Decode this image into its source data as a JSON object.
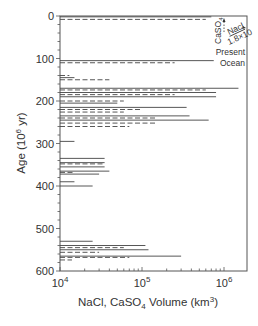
{
  "chart_data": {
    "type": "bar",
    "orientation": "horizontal",
    "title": "",
    "xlabel": "NaCl, CaSO4 Volume (km3)",
    "xlabel_parts": {
      "pre": "NaCl, CaSO",
      "sub": "4",
      "mid": " Volume (km",
      "sup": "3",
      "post": ")"
    },
    "ylabel": "Age (10^6 yr)",
    "ylabel_parts": {
      "pre": "Age (10",
      "sup": "6",
      "post": " yr)"
    },
    "xscale": "log",
    "xlim": [
      10000,
      2000000
    ],
    "ylim": [
      0,
      600
    ],
    "y_inverted": true,
    "grid": false,
    "x_ticks": [
      {
        "base": "10",
        "exp": "4",
        "value": 10000
      },
      {
        "base": "10",
        "exp": "5",
        "value": 100000
      },
      {
        "base": "10",
        "exp": "6",
        "value": 1000000
      }
    ],
    "y_ticks": [
      "0",
      "100",
      "200",
      "300",
      "400",
      "500",
      "600"
    ],
    "legend": [
      {
        "name": "NaCl",
        "style": "solid"
      },
      {
        "name": "CaSO4",
        "style": "dashed"
      }
    ],
    "annotation": {
      "caso4_label": "CaSO",
      "caso4_sub": "4",
      "nacl_label": "Nacl",
      "factor": "1.8×10",
      "present_label": "Present",
      "ocean_label": "Ocean"
    },
    "series": [
      {
        "name": "NaCl",
        "style": "solid",
        "points": [
          {
            "age": 2,
            "volume": 700000
          },
          {
            "age": 105,
            "volume": 750000
          },
          {
            "age": 145,
            "volume": 15000
          },
          {
            "age": 170,
            "volume": 1500000
          },
          {
            "age": 180,
            "volume": 800000
          },
          {
            "age": 190,
            "volume": 800000
          },
          {
            "age": 205,
            "volume": 50000
          },
          {
            "age": 215,
            "volume": 350000
          },
          {
            "age": 235,
            "volume": 380000
          },
          {
            "age": 245,
            "volume": 650000
          },
          {
            "age": 295,
            "volume": 15000
          },
          {
            "age": 335,
            "volume": 35000
          },
          {
            "age": 345,
            "volume": 35000
          },
          {
            "age": 355,
            "volume": 35000
          },
          {
            "age": 365,
            "volume": 40000
          },
          {
            "age": 372,
            "volume": 30000
          },
          {
            "age": 390,
            "volume": 15000
          },
          {
            "age": 400,
            "volume": 25000
          },
          {
            "age": 530,
            "volume": 25000
          },
          {
            "age": 540,
            "volume": 110000
          },
          {
            "age": 550,
            "volume": 120000
          },
          {
            "age": 565,
            "volume": 300000
          }
        ]
      },
      {
        "name": "CaSO4",
        "style": "dashed",
        "points": [
          {
            "age": 8,
            "volume": 600000
          },
          {
            "age": 110,
            "volume": 250000
          },
          {
            "age": 140,
            "volume": 13000
          },
          {
            "age": 150,
            "volume": 40000
          },
          {
            "age": 174,
            "volume": 600000
          },
          {
            "age": 185,
            "volume": 250000
          },
          {
            "age": 200,
            "volume": 60000
          },
          {
            "age": 220,
            "volume": 100000
          },
          {
            "age": 226,
            "volume": 60000
          },
          {
            "age": 240,
            "volume": 150000
          },
          {
            "age": 252,
            "volume": 150000
          },
          {
            "age": 260,
            "volume": 70000
          },
          {
            "age": 348,
            "volume": 33000
          },
          {
            "age": 368,
            "volume": 15000
          },
          {
            "age": 545,
            "volume": 60000
          },
          {
            "age": 556,
            "volume": 30000
          },
          {
            "age": 568,
            "volume": 70000
          },
          {
            "age": 574,
            "volume": 14000
          }
        ]
      }
    ]
  }
}
